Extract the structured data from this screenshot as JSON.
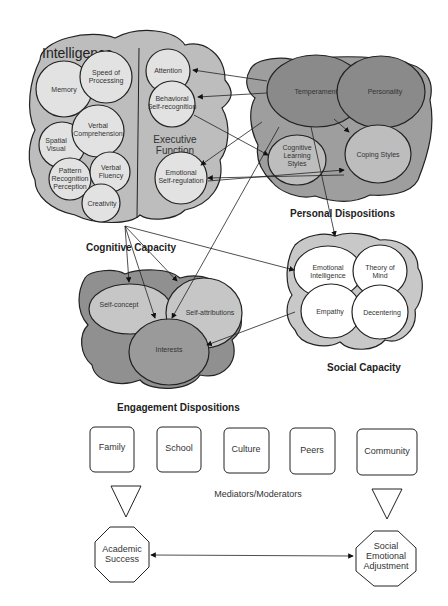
{
  "colors": {
    "light_gray": "#d8d8d8",
    "mid_gray": "#b9b9b9",
    "dark_gray": "#8e8e8e",
    "circle_fill": "#e2e2e2",
    "white": "#ffffff",
    "stroke": "#222222"
  },
  "cognitive_capacity": {
    "title": "Cognitive Capacity",
    "intelligence": {
      "heading": "Intelligence",
      "items": [
        "Memory",
        "Speed of Processing",
        "Spatial Visual",
        "Verbal Comprehension",
        "Pattern Recognition Perception",
        "Verbal Fluency",
        "Creativity"
      ]
    },
    "executive_function": {
      "heading": "Executive Function",
      "items": [
        "Attention",
        "Behavioral Self-recognition",
        "Emotional Self-regulation"
      ]
    }
  },
  "personal_dispositions": {
    "title": "Personal Dispositions",
    "items": [
      "Temperament",
      "Personality",
      "Cognitive Learning Styles",
      "Coping Styles"
    ]
  },
  "social_capacity": {
    "title": "Social Capacity",
    "items": [
      "Emotional Intelligence",
      "Theory of Mind",
      "Empathy",
      "Decentering"
    ]
  },
  "engagement_dispositions": {
    "title": "Engagement Dispositions",
    "items": [
      "Self-concept",
      "Self-attributions",
      "Interests"
    ]
  },
  "mediators": {
    "label": "Mediators/Moderators",
    "boxes": [
      "Family",
      "School",
      "Culture",
      "Peers",
      "Community"
    ]
  },
  "outcomes": {
    "left": "Academic Success",
    "right": "Social Emotional Adjustment"
  }
}
